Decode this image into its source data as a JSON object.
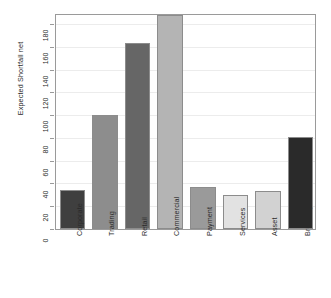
{
  "chart_data": {
    "type": "bar",
    "title": "",
    "subtitle": "",
    "xlabel": "",
    "ylabel": "Expected Shortfall net",
    "categories": [
      "Corporate",
      "Trading",
      "Retail",
      "Commercial",
      "Payment",
      "Services",
      "Asset",
      "Brokerage"
    ],
    "values": [
      34,
      100,
      163,
      188,
      37,
      30,
      33,
      81
    ],
    "bar_colors": [
      "#3f3f3f",
      "#8d8d8d",
      "#666666",
      "#b4b4b4",
      "#9a9a9a",
      "#e2e2e2",
      "#d2d2d2",
      "#2a2a2a"
    ],
    "ylim": [
      0,
      188
    ],
    "yticks": [
      0,
      20,
      40,
      60,
      80,
      100,
      120,
      140,
      160,
      180
    ],
    "ytick_labels": [
      "0",
      "20",
      "40",
      "60",
      "80",
      "100",
      "120",
      "140",
      "160",
      "180"
    ],
    "grid": true,
    "grid_color": "#ececec",
    "legend": null,
    "legend_position": "none",
    "axis_color": "#9a9a9a",
    "background": "#ffffff"
  }
}
